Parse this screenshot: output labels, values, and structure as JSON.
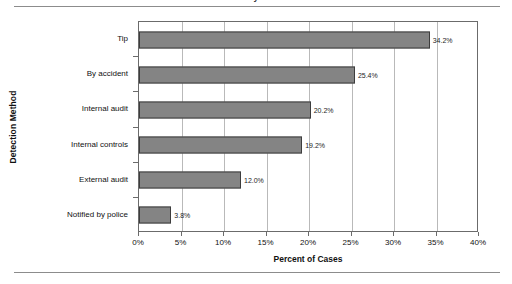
{
  "figure": {
    "cropped_title_fragment": "y",
    "top_rule": true,
    "bottom_rule": true
  },
  "chart_data": {
    "type": "bar",
    "orientation": "horizontal",
    "title": "",
    "xlabel": "Percent of Cases",
    "ylabel": "Detection Method",
    "categories": [
      "Tip",
      "By accident",
      "Internal audit",
      "Internal controls",
      "External audit",
      "Notified by police"
    ],
    "values": [
      34.2,
      25.4,
      20.2,
      19.2,
      12.0,
      3.8
    ],
    "data_labels": [
      "34.2%",
      "25.4%",
      "20.2%",
      "19.2%",
      "12.0%",
      "3.8%"
    ],
    "xlim": [
      0,
      40
    ],
    "xticks": [
      0,
      5,
      10,
      15,
      20,
      25,
      30,
      35,
      40
    ],
    "xtick_labels": [
      "0%",
      "5%",
      "10%",
      "15%",
      "20%",
      "25%",
      "30%",
      "35%",
      "40%"
    ],
    "grid": "vertical",
    "legend": null,
    "bar_color": "#848484",
    "bar_border_color": "#3d3d3d",
    "gridline_color": "#b9b9b9",
    "axis_color": "#6b6b6b"
  }
}
